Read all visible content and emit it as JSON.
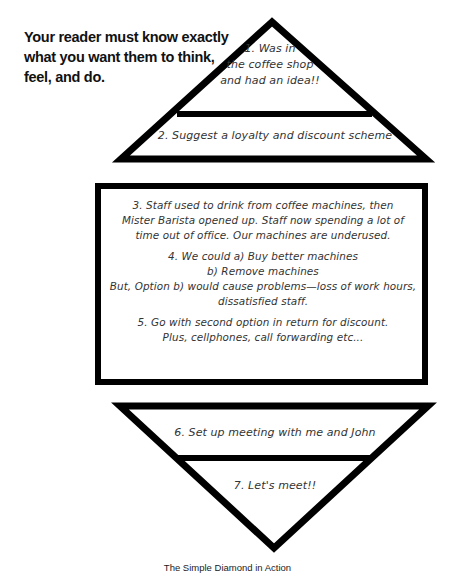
{
  "headline": {
    "lines": [
      "Your reader must know exactly",
      "what you want them to think,",
      "feel, and do."
    ]
  },
  "diagram": {
    "top_triangle": {
      "section1": {
        "lines": [
          "1. Was in",
          "the coffee shop",
          "and had an idea!!"
        ]
      },
      "section2": {
        "text": "2. Suggest a loyalty and discount scheme"
      }
    },
    "middle_box": {
      "section3": {
        "lines": [
          "3. Staff used to drink from coffee machines, then",
          "Mister Barista opened up. Staff now spending a lot of",
          "time out of office. Our machines are underused."
        ]
      },
      "section4": {
        "lines": [
          "4. We could a) Buy better machines",
          "b) Remove machines",
          "But, Option b) would cause problems—loss of work hours,",
          "dissatisfied staff."
        ]
      },
      "section5": {
        "lines": [
          "5. Go with second option in return for discount.",
          "Plus, cellphones, call forwarding etc..."
        ]
      }
    },
    "bottom_triangle": {
      "section6": {
        "text": "6. Set up meeting with me and John"
      },
      "section7": {
        "text": "7. Let's meet!!"
      }
    },
    "stroke_color": "#000000",
    "fill_color": "#ffffff"
  },
  "caption": "The Simple Diamond in Action"
}
